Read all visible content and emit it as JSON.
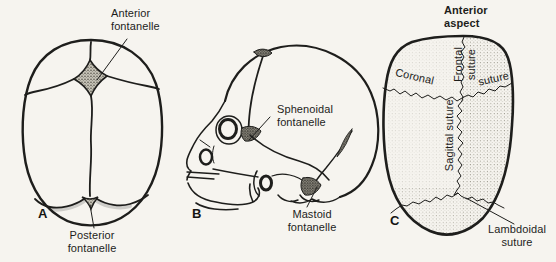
{
  "colors": {
    "background": "#f6f4ef",
    "ink": "#1d1d1b",
    "stipple_dark": "#26251f",
    "stipple_light": "#8f8c80"
  },
  "panel_a": {
    "letter": "A",
    "anterior_fontanelle": {
      "line1": "Anterior",
      "line2": "fontanelle"
    },
    "posterior_fontanelle": {
      "line1": "Posterior",
      "line2": "fontanelle"
    }
  },
  "panel_b": {
    "letter": "B",
    "sphenoidal_fontanelle": {
      "line1": "Sphenoidal",
      "line2": "fontanelle"
    },
    "mastoid_fontanelle": {
      "line1": "Mastoid",
      "line2": "fontanelle"
    }
  },
  "panel_c": {
    "letter": "C",
    "heading": {
      "line1": "Anterior",
      "line2": "aspect"
    },
    "coronal_label": "Coronal",
    "coronal_suture_word": "suture",
    "frontal_suture": {
      "line1": "Frontal",
      "line2": "suture"
    },
    "sagittal_suture": "Sagittal suture",
    "lambdoidal_suture": {
      "line1": "Lambdoidal",
      "line2": "suture"
    }
  }
}
